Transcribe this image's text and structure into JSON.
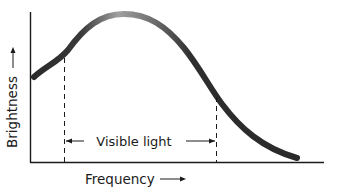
{
  "diagram": {
    "type": "spectrum-curve",
    "y_axis": {
      "label": "Brightness",
      "arrow": "up"
    },
    "x_axis": {
      "label": "Frequency",
      "arrow": "right"
    },
    "band": {
      "label": "Visible light",
      "left_marker_x": 64,
      "right_marker_x": 216
    },
    "curve": {
      "description": "Brightness vs frequency curve rising to a peak then falling",
      "color_start": "#2a2a2a",
      "color_peak": "#9a9a9a",
      "color_end": "#2a2a2a"
    },
    "colors": {
      "line": "#1a1a1a",
      "background": "#ffffff"
    }
  }
}
